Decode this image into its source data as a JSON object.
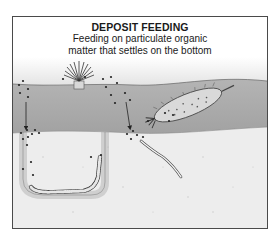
{
  "diagram": {
    "title": "DEPOSIT FEEDING",
    "subtitle_line1": "Feeding on particulate organic",
    "subtitle_line2": "matter that settles on the bottom",
    "organisms": [
      {
        "name": "tube-dwelling fan worm",
        "position": "left-center, on sediment surface"
      },
      {
        "name": "sea cucumber",
        "position": "right, crawling on sediment surface"
      },
      {
        "name": "burrowing worm in U-shaped burrow",
        "position": "lower left, in sediment"
      },
      {
        "name": "slender burrowing worm",
        "position": "lower center, in sediment"
      }
    ],
    "elements": {
      "water": "gradient gray water column with falling organic particles",
      "sediment_surface": "gray band",
      "subsurface": "light speckled sediment",
      "arrows": [
        "particles sinking into left burrow",
        "particles sinking into center burrow"
      ]
    },
    "colors": {
      "frame": "#4a4a4a",
      "water_top": "#ffffff",
      "water_bottom": "#bdbdbd",
      "sediment_band": "#a9a9a9",
      "subsurface": "#ededed",
      "particle": "#222222"
    }
  }
}
